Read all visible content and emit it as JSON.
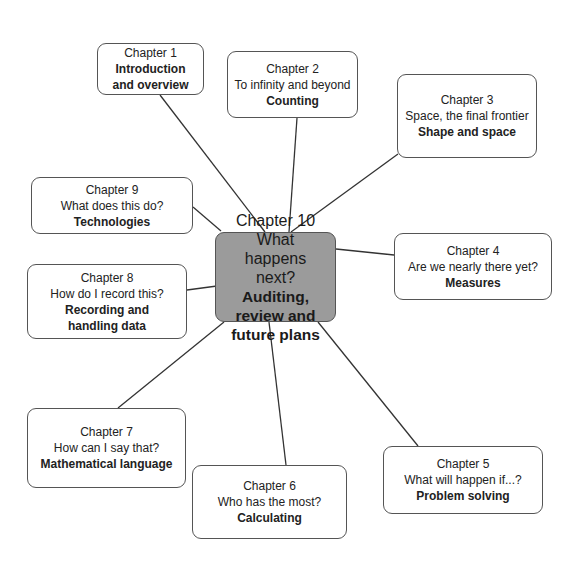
{
  "diagram": {
    "center": {
      "title": "Chapter 10",
      "subtitle": "What happens next?",
      "topic": "Auditing, review and future plans",
      "fill_color": "#9b9b9b"
    },
    "nodes": [
      {
        "id": "ch1",
        "title": "Chapter 1",
        "subtitle": "",
        "topic": "Introduction and overview"
      },
      {
        "id": "ch2",
        "title": "Chapter 2",
        "subtitle": "To infinity and beyond",
        "topic": "Counting"
      },
      {
        "id": "ch3",
        "title": "Chapter 3",
        "subtitle": "Space, the final frontier",
        "topic": "Shape and space"
      },
      {
        "id": "ch4",
        "title": "Chapter 4",
        "subtitle": "Are we nearly there yet?",
        "topic": "Measures"
      },
      {
        "id": "ch5",
        "title": "Chapter 5",
        "subtitle": "What will happen if...?",
        "topic": "Problem solving"
      },
      {
        "id": "ch6",
        "title": "Chapter 6",
        "subtitle": "Who has the most?",
        "topic": "Calculating"
      },
      {
        "id": "ch7",
        "title": "Chapter 7",
        "subtitle": "How can I say that?",
        "topic": "Mathematical language"
      },
      {
        "id": "ch8",
        "title": "Chapter 8",
        "subtitle": "How do I record this?",
        "topic": "Recording and handling data"
      },
      {
        "id": "ch9",
        "title": "Chapter 9",
        "subtitle": "What does this do?",
        "topic": "Technologies"
      }
    ],
    "edges": [
      [
        "ch10",
        "ch1"
      ],
      [
        "ch10",
        "ch2"
      ],
      [
        "ch10",
        "ch3"
      ],
      [
        "ch10",
        "ch4"
      ],
      [
        "ch10",
        "ch5"
      ],
      [
        "ch10",
        "ch6"
      ],
      [
        "ch10",
        "ch7"
      ],
      [
        "ch10",
        "ch8"
      ],
      [
        "ch10",
        "ch9"
      ]
    ]
  }
}
